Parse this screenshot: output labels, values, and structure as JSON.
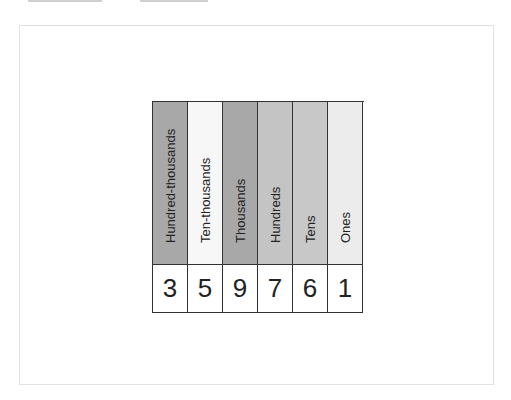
{
  "place_value_chart": {
    "columns": [
      {
        "label": "Hundred-thousands",
        "digit": "3",
        "color": "#a8a8a8"
      },
      {
        "label": "Ten-thousands",
        "digit": "5",
        "color": "#f7f7f7"
      },
      {
        "label": "Thousands",
        "digit": "9",
        "color": "#a8a8a8"
      },
      {
        "label": "Hundreds",
        "digit": "7",
        "color": "#c4c4c4"
      },
      {
        "label": "Tens",
        "digit": "6",
        "color": "#c8c8c8"
      },
      {
        "label": "Ones",
        "digit": "1",
        "color": "#ececec"
      }
    ],
    "number": "359761"
  }
}
